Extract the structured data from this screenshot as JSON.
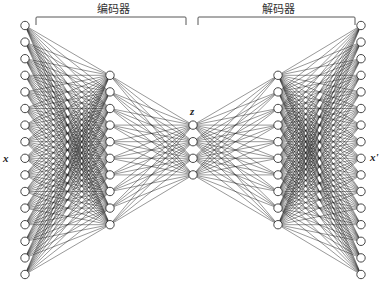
{
  "diagram": {
    "type": "autoencoder-network",
    "sections": {
      "encoder_label": "编码器",
      "decoder_label": "解码器"
    },
    "labels": {
      "input": "x",
      "latent": "z",
      "output": "x'"
    },
    "layers": [
      {
        "name": "input",
        "nodes": 16
      },
      {
        "name": "encoder-hidden",
        "nodes": 10
      },
      {
        "name": "latent",
        "nodes": 4
      },
      {
        "name": "decoder-hidden",
        "nodes": 10
      },
      {
        "name": "output",
        "nodes": 16
      }
    ],
    "connectivity": "fully-connected"
  }
}
